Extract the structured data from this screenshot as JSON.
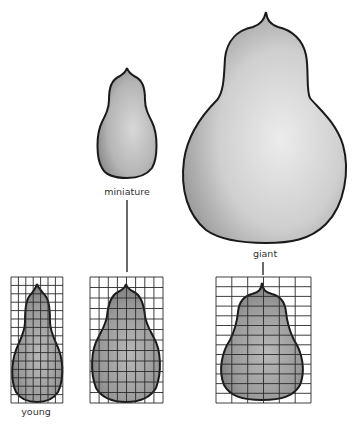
{
  "diagram": {
    "type": "illustration",
    "labels": {
      "miniature": "miniature",
      "giant": "giant",
      "young": "young"
    },
    "gourds": [
      {
        "id": "miniature",
        "label": "miniature",
        "position": "top-center",
        "size": "small"
      },
      {
        "id": "giant",
        "label": "giant",
        "position": "top-right",
        "size": "large"
      },
      {
        "id": "young-grid",
        "label": "young",
        "position": "bottom-left",
        "grid_cols": 7,
        "grid_rows": 15
      },
      {
        "id": "miniature-grid",
        "label": "",
        "position": "bottom-center",
        "grid_cols": 8,
        "grid_rows": 12
      },
      {
        "id": "giant-grid",
        "label": "",
        "position": "bottom-right",
        "grid_cols": 6,
        "grid_rows": 13
      }
    ],
    "colors": {
      "background": "#ffffff",
      "outline": "#1a1a1a",
      "gourd_fill_light": "#d9d9d9",
      "gourd_fill_dark": "#8a8a8a",
      "grid_line": "#2a2a2a"
    }
  }
}
